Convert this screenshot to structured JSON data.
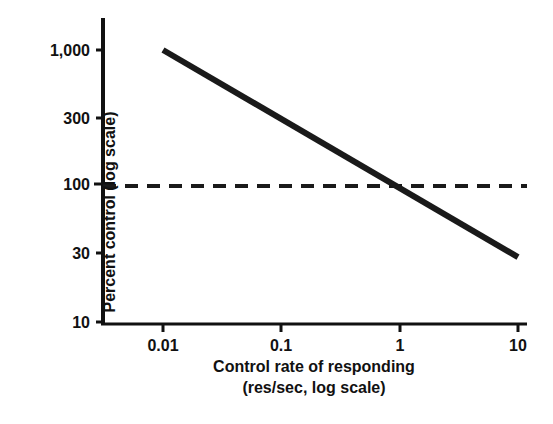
{
  "chart_data": {
    "type": "line",
    "title": "",
    "xlabel": "Control rate of responding (res/sec, log scale)",
    "xlabel_line1": "Control rate of responding",
    "xlabel_line2": "(res/sec, log scale)",
    "ylabel": "Percent control (log scale)",
    "xscale": "log",
    "yscale": "log",
    "xlim": [
      0.01,
      10
    ],
    "ylim": [
      10,
      1000
    ],
    "grid": false,
    "legend": "none",
    "xticks": [
      "0.01",
      "0.1",
      "1",
      "10"
    ],
    "xtick_values": [
      0.01,
      0.1,
      1,
      10
    ],
    "yticks": [
      "1,000",
      "300",
      "100",
      "30",
      "10"
    ],
    "ytick_values": [
      1000,
      300,
      100,
      30,
      10
    ],
    "series": [
      {
        "name": "behavioral contrast function",
        "style": "solid",
        "color": "#1a1a1a",
        "width": 6,
        "x": [
          0.01,
          10
        ],
        "y": [
          1000,
          30
        ],
        "points": [
          {
            "x": 0.01,
            "y": 1000
          },
          {
            "x": 0.1,
            "y": 320
          },
          {
            "x": 1,
            "y": 100
          },
          {
            "x": 10,
            "y": 30
          }
        ]
      },
      {
        "name": "baseline reference",
        "style": "dashed",
        "color": "#1a1a1a",
        "width": 4,
        "x": [
          0.01,
          10
        ],
        "y": [
          100,
          100
        ],
        "annotation": "horizontal reference line at 100 percent control"
      }
    ],
    "annotations": [
      {
        "text": "crossing point of the data line and the 100% reference line at x = 1",
        "x": 1,
        "y": 100
      }
    ]
  },
  "axes": {
    "y_title": "Percent control (log scale)",
    "x_title_line1": "Control rate of responding",
    "x_title_line2": "(res/sec, log scale)",
    "y_labels": {
      "t1000": "1,000",
      "t300": "300",
      "t100": "100",
      "t30": "30",
      "t10": "10"
    },
    "x_labels": {
      "t001": "0.01",
      "t01": "0.1",
      "t1": "1",
      "t10": "10"
    }
  },
  "colors": {
    "background": "#ffffff",
    "ink": "#1a1a1a",
    "axis": "#111111"
  }
}
